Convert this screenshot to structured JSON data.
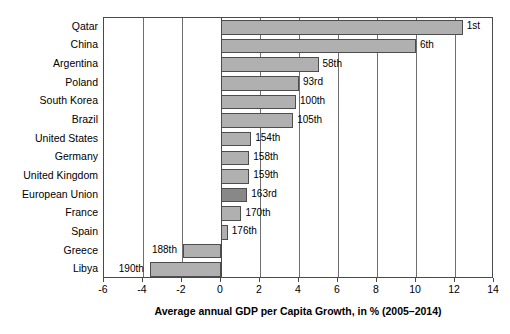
{
  "chart_data": {
    "type": "bar",
    "orientation": "horizontal",
    "title": "",
    "xlabel": "Average annual GDP per Capita Growth, in % (2005–2014)",
    "ylabel": "",
    "xlim": [
      -6,
      14
    ],
    "xticks": [
      -6,
      -4,
      -2,
      0,
      2,
      4,
      6,
      8,
      10,
      12,
      14
    ],
    "xticklabels": [
      "-6",
      "-4",
      "-2",
      "0",
      "2",
      "4",
      "6",
      "8",
      "10",
      "12",
      "14"
    ],
    "grid": true,
    "legend": "none",
    "categories": [
      "Qatar",
      "China",
      "Argentina",
      "Poland",
      "South Korea",
      "Brazil",
      "United States",
      "Germany",
      "United Kingdom",
      "European Union",
      "France",
      "Spain",
      "Greece",
      "Libya"
    ],
    "values": [
      12.4,
      10.0,
      5.0,
      4.0,
      3.85,
      3.7,
      1.55,
      1.45,
      1.45,
      1.35,
      1.05,
      0.35,
      -1.95,
      -3.65
    ],
    "annotations": [
      "1st",
      "6th",
      "58th",
      "93rd",
      "100th",
      "105th",
      "154th",
      "158th",
      "159th",
      "163rd",
      "170th",
      "176th",
      "188th",
      "190th"
    ],
    "highlight_category": "European Union",
    "colors": {
      "bar_fill": "#b0b0b0",
      "bar_highlight_fill": "#888888",
      "bar_edge": "#4d4d4d",
      "axis": "#4a4a4a",
      "grid": "#6f6f6f",
      "text": "#000000",
      "background": "#ffffff"
    }
  }
}
